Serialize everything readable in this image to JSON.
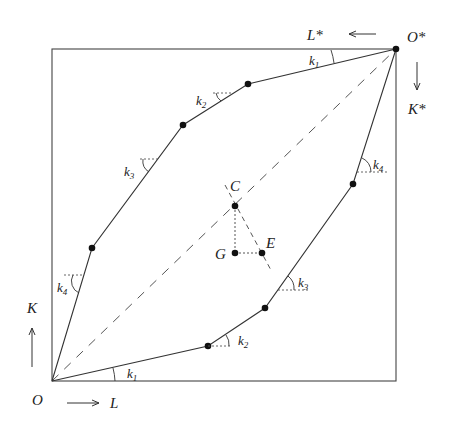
{
  "corners": {
    "origin": "O",
    "origin_star": "O*",
    "labor": "L",
    "capital": "K",
    "labor_star": "L*",
    "capital_star": "K*"
  },
  "points": {
    "C": "C",
    "G": "G",
    "E": "E"
  },
  "angle_labels": {
    "upper": [
      "k1",
      "k2",
      "k3",
      "k4"
    ],
    "lower": [
      "k1",
      "k2",
      "k3",
      "k4"
    ],
    "base": "k",
    "subs": [
      "1",
      "2",
      "3",
      "4"
    ]
  },
  "colors": {
    "line": "#333333",
    "dot": "#111111",
    "background": "#ffffff"
  }
}
